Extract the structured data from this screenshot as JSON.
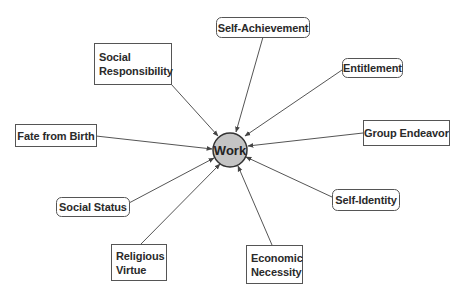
{
  "diagram": {
    "center": {
      "label": "Work",
      "cx": 230,
      "cy": 150,
      "r": 17,
      "fill": "#c4c4c4",
      "stroke": "#333333"
    },
    "colors": {
      "box_stroke": "#555555",
      "arrow": "#555555",
      "box_fill": "#ffffff"
    },
    "nodes": [
      {
        "id": "self-achievement",
        "label": "Self-Achievement",
        "lines": [
          "Self-Achievement"
        ],
        "shape": "rounded",
        "x": 216,
        "y": 17,
        "w": 93,
        "h": 20,
        "ax": 263,
        "ay": 37,
        "tx": 236,
        "ty": 132
      },
      {
        "id": "social-responsibility",
        "label": "Social Responsibility",
        "lines": [
          "Social",
          "Responsibility"
        ],
        "shape": "rect",
        "x": 94,
        "y": 43,
        "w": 77,
        "h": 41,
        "ax": 171,
        "ay": 84,
        "tx": 218,
        "ty": 136
      },
      {
        "id": "entitlement",
        "label": "Entitlement",
        "lines": [
          "Entitlement"
        ],
        "shape": "rounded",
        "x": 342,
        "y": 58,
        "w": 60,
        "h": 19,
        "ax": 342,
        "ay": 70,
        "tx": 245,
        "ty": 136
      },
      {
        "id": "group-endeavor",
        "label": "Group Endeavor",
        "lines": [
          "Group Endeavor"
        ],
        "shape": "rect",
        "x": 363,
        "y": 120,
        "w": 86,
        "h": 25,
        "ax": 363,
        "ay": 133,
        "tx": 248,
        "ty": 146
      },
      {
        "id": "fate-from-birth",
        "label": "Fate from Birth",
        "lines": [
          "Fate from Birth"
        ],
        "shape": "rect",
        "x": 15,
        "y": 124,
        "w": 81,
        "h": 22,
        "ax": 96,
        "ay": 136,
        "tx": 212,
        "ty": 149
      },
      {
        "id": "social-status",
        "label": "Social Status",
        "lines": [
          "Social Status"
        ],
        "shape": "rounded",
        "x": 56,
        "y": 197,
        "w": 73,
        "h": 19,
        "ax": 129,
        "ay": 203,
        "tx": 214,
        "ty": 158
      },
      {
        "id": "self-identity",
        "label": "Self-Identity",
        "lines": [
          "Self-Identity"
        ],
        "shape": "rounded",
        "x": 332,
        "y": 189,
        "w": 67,
        "h": 21,
        "ax": 332,
        "ay": 197,
        "tx": 246,
        "ty": 157
      },
      {
        "id": "religious-virtue",
        "label": "Religious Virtue",
        "lines": [
          "Religious",
          "Virtue"
        ],
        "shape": "rect",
        "x": 111,
        "y": 244,
        "w": 55,
        "h": 36,
        "ax": 141,
        "ay": 244,
        "tx": 220,
        "ty": 164
      },
      {
        "id": "economic-necessity",
        "label": "Economic Necessity",
        "lines": [
          "Economic",
          "Necessity"
        ],
        "shape": "rect",
        "x": 246,
        "y": 245,
        "w": 56,
        "h": 38,
        "ax": 272,
        "ay": 245,
        "tx": 238,
        "ty": 166
      }
    ]
  }
}
